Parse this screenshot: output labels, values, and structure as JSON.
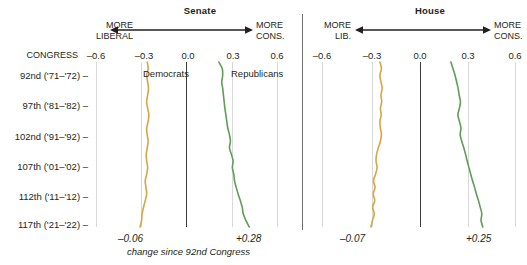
{
  "chart_data": {
    "type": "line",
    "caption": "change since 92nd Congress",
    "orientation": "vertical-categories",
    "grid": true,
    "legend_position": "inline-top",
    "xlabel": "",
    "ylabel": "CONGRESS",
    "xlim": [
      -0.75,
      0.75
    ],
    "xticks": [
      -0.6,
      -0.3,
      0.0,
      0.3,
      0.6
    ],
    "xtick_labels": [
      "–0.6",
      "–0.3",
      "0.0",
      "0.3",
      "0.6"
    ],
    "categories": [
      "92nd ('71–'72)",
      "97th ('81–'82)",
      "102nd ('91–'92)",
      "107th ('01–'02)",
      "112th ('11–'12)",
      "117th ('21–'22)"
    ],
    "panels": [
      {
        "name": "Senate",
        "title": "Senate",
        "left_caption_line1": "MORE",
        "left_caption_line2": "LIBERAL",
        "right_caption_line1": "MORE",
        "right_caption_line2": "CONS.",
        "series": [
          {
            "name": "Democrats",
            "label": "Democrats",
            "color": "#d9a441",
            "delta": "–0.06",
            "values": [
              -0.325,
              -0.318,
              -0.33,
              -0.322,
              -0.315,
              -0.322,
              -0.33,
              -0.322,
              -0.312,
              -0.318,
              -0.33,
              -0.326,
              -0.318,
              -0.325,
              -0.334,
              -0.33,
              -0.322,
              -0.33,
              -0.342,
              -0.336,
              -0.33,
              -0.342,
              -0.356,
              -0.368,
              -0.372,
              -0.385
            ]
          },
          {
            "name": "Republicans",
            "label": "Republicans",
            "color": "#5f9c57",
            "delta": "+0.28",
            "values": [
              0.268,
              0.296,
              0.3,
              0.292,
              0.3,
              0.306,
              0.312,
              0.318,
              0.326,
              0.334,
              0.342,
              0.356,
              0.364,
              0.356,
              0.372,
              0.386,
              0.38,
              0.392,
              0.398,
              0.412,
              0.428,
              0.446,
              0.462,
              0.47,
              0.492,
              0.52
            ]
          }
        ]
      },
      {
        "name": "House",
        "title": "House",
        "left_caption_line1": "MORE",
        "left_caption_line2": "LIB.",
        "right_caption_line1": "MORE",
        "right_caption_line2": "CONS.",
        "series": [
          {
            "name": "Democrats",
            "label": "",
            "color": "#d9a441",
            "delta": "–0.07",
            "values": [
              -0.3,
              -0.288,
              -0.3,
              -0.292,
              -0.282,
              -0.292,
              -0.286,
              -0.296,
              -0.29,
              -0.3,
              -0.296,
              -0.288,
              -0.296,
              -0.312,
              -0.326,
              -0.33,
              -0.322,
              -0.334,
              -0.35,
              -0.338,
              -0.352,
              -0.34,
              -0.356,
              -0.344,
              -0.358,
              -0.37
            ]
          },
          {
            "name": "Republicans",
            "label": "",
            "color": "#5f9c57",
            "delta": "+0.25",
            "values": [
              0.252,
              0.268,
              0.284,
              0.296,
              0.308,
              0.316,
              0.326,
              0.318,
              0.306,
              0.318,
              0.33,
              0.324,
              0.336,
              0.352,
              0.366,
              0.378,
              0.392,
              0.406,
              0.42,
              0.436,
              0.45,
              0.466,
              0.48,
              0.492,
              0.486,
              0.5
            ]
          }
        ]
      }
    ]
  },
  "labels": {
    "congress_header": "CONGRESS",
    "row_tick": "–"
  }
}
